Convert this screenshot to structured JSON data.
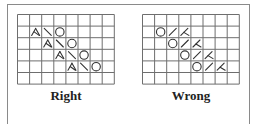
{
  "figure": {
    "charts": [
      {
        "id": "right",
        "caption": "Right",
        "cols": 8,
        "rows": 6,
        "symbols": [
          {
            "row": 1,
            "col": 1,
            "type": "ssk"
          },
          {
            "row": 1,
            "col": 2,
            "type": "backslash"
          },
          {
            "row": 1,
            "col": 3,
            "type": "yo"
          },
          {
            "row": 2,
            "col": 2,
            "type": "ssk"
          },
          {
            "row": 2,
            "col": 3,
            "type": "backslash"
          },
          {
            "row": 2,
            "col": 4,
            "type": "yo"
          },
          {
            "row": 3,
            "col": 3,
            "type": "ssk"
          },
          {
            "row": 3,
            "col": 4,
            "type": "backslash"
          },
          {
            "row": 3,
            "col": 5,
            "type": "yo"
          },
          {
            "row": 4,
            "col": 4,
            "type": "ssk"
          },
          {
            "row": 4,
            "col": 5,
            "type": "backslash"
          },
          {
            "row": 4,
            "col": 6,
            "type": "yo"
          }
        ]
      },
      {
        "id": "wrong",
        "caption": "Wrong",
        "cols": 8,
        "rows": 6,
        "symbols": [
          {
            "row": 1,
            "col": 1,
            "type": "yo"
          },
          {
            "row": 1,
            "col": 2,
            "type": "slash"
          },
          {
            "row": 1,
            "col": 3,
            "type": "k2tog"
          },
          {
            "row": 2,
            "col": 2,
            "type": "yo"
          },
          {
            "row": 2,
            "col": 3,
            "type": "slash"
          },
          {
            "row": 2,
            "col": 4,
            "type": "k2tog"
          },
          {
            "row": 3,
            "col": 3,
            "type": "yo"
          },
          {
            "row": 3,
            "col": 4,
            "type": "slash"
          },
          {
            "row": 3,
            "col": 5,
            "type": "k2tog"
          },
          {
            "row": 4,
            "col": 4,
            "type": "yo"
          },
          {
            "row": 4,
            "col": 5,
            "type": "slash"
          },
          {
            "row": 4,
            "col": 6,
            "type": "k2tog"
          }
        ]
      }
    ],
    "colors": {
      "grid": "#6e6e6e",
      "symbol": "#333333",
      "frame": "#8a8a8a"
    }
  }
}
